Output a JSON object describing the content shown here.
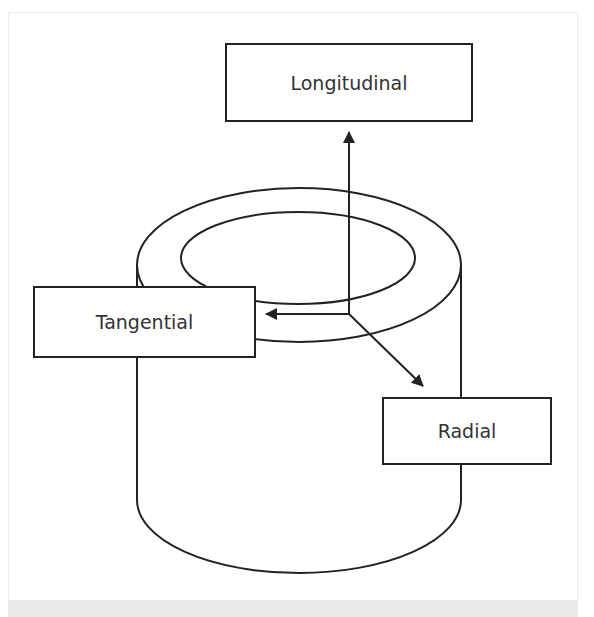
{
  "diagram": {
    "labels": {
      "longitudinal": "Longitudinal",
      "tangential": "Tangential",
      "radial": "Radial"
    },
    "colors": {
      "stroke": "#222222",
      "text": "#333333",
      "background": "#ffffff",
      "frame_border": "#ececec",
      "bottom_band": "#ebebeb"
    },
    "shapes": {
      "cylinder": "hollow-tube",
      "arrows": [
        "longitudinal-up",
        "tangential-left",
        "radial-diagonal"
      ]
    }
  }
}
